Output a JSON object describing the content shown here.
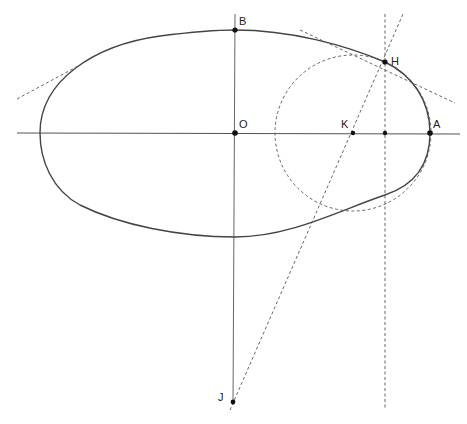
{
  "diagram": {
    "type": "geometric-construction",
    "points": [
      {
        "name": "B",
        "label": "B",
        "x": 235,
        "y": 30
      },
      {
        "name": "O",
        "label": "O",
        "x": 235,
        "y": 133
      },
      {
        "name": "K",
        "label": "K",
        "x": 353,
        "y": 133
      },
      {
        "name": "A",
        "label": "A",
        "x": 430,
        "y": 133
      },
      {
        "name": "H",
        "label": "H",
        "x": 385,
        "y": 62
      },
      {
        "name": "J",
        "label": "J",
        "x": 233,
        "y": 402
      }
    ],
    "unlabeled_points": [
      {
        "name": "foot-of-H",
        "x": 385,
        "y": 133
      }
    ],
    "colors": {
      "curve": "#444444",
      "axis": "#555555",
      "dashed": "#555555",
      "point": "#111111",
      "label": "#222222"
    }
  }
}
